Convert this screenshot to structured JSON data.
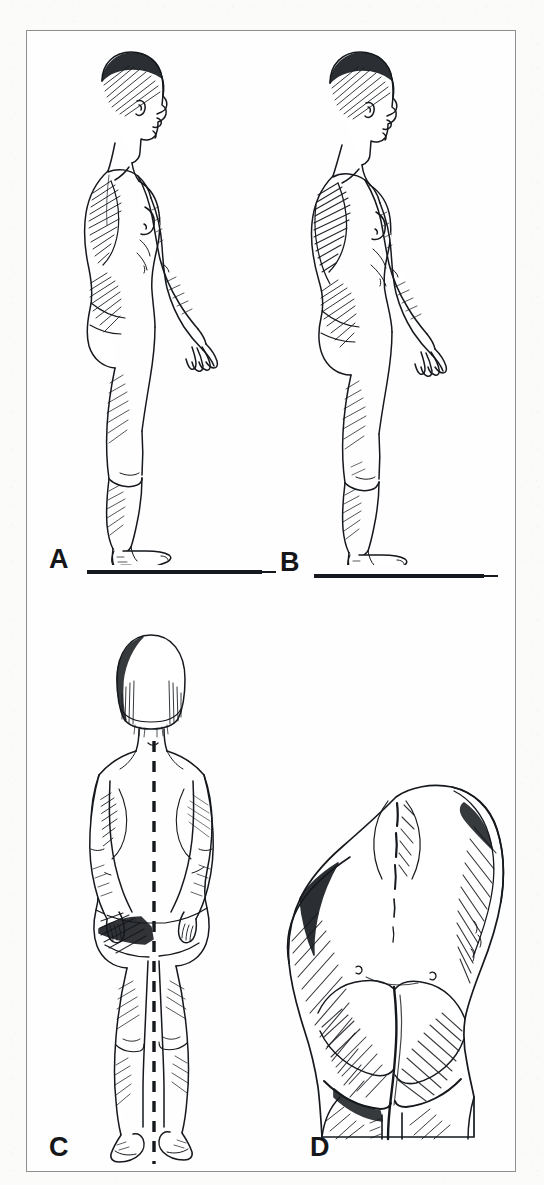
{
  "figure": {
    "medium": "pen-and-ink hatched medical illustration on scanned book page",
    "frame": {
      "border_color": "#8d8f90",
      "page_color": "#fbfbfa",
      "plate_color": "#fefefe"
    },
    "ink_color": "#15181c"
  },
  "panels": [
    {
      "id": "A",
      "label": "A",
      "view": "lateral (side) view, subject facing viewer-right",
      "subject": "standing nude adult female, full body, arms hanging at sides",
      "features": [
        "normal thoracic kyphosis",
        "moderate lumbar lordosis",
        "scapular hatching on posterior thorax",
        "feet flat on a solid horizontal ground line"
      ],
      "has_ground_line": true,
      "has_plumb_line": false
    },
    {
      "id": "B",
      "label": "B",
      "view": "lateral (side) view, subject facing viewer-right",
      "subject": "standing nude adult female, full body, arms hanging at sides",
      "features": [
        "increased thoracic kyphosis (rounded upper back)",
        "forward head posture",
        "protruding abdomen and exaggerated lumbar curve",
        "heavy posterior hatching along the back",
        "feet flat on a solid horizontal ground line"
      ],
      "has_ground_line": true,
      "has_plumb_line": false
    },
    {
      "id": "C",
      "label": "C",
      "view": "posterior (back) view",
      "subject": "standing nude adult female with short bobbed hair, arms at sides",
      "features": [
        "vertical dashed plumb line dropped from the C7 spinous process",
        "plumb line passes through the gluteal cleft and between the legs",
        "lateral trunk and pelvic asymmetry relative to the plumb line",
        "hatched shading on the left flank and gluteal fold"
      ],
      "has_ground_line": false,
      "has_plumb_line": true,
      "plumb_line_style": "dashed"
    },
    {
      "id": "D",
      "label": "D",
      "view": "posterior close-up, oblique",
      "subject": "lower back, pelvis and buttocks detail",
      "features": [
        "dense diagonal hatching modelling the gluteal and flank contours",
        "visible spinal furrow and dimples of Venus",
        "asymmetric gluteal folds",
        "upper thighs entering the lower edge of the crop"
      ],
      "has_ground_line": false,
      "has_plumb_line": false
    }
  ],
  "labels": {
    "a": "A",
    "b": "B",
    "c": "C",
    "d": "D"
  }
}
